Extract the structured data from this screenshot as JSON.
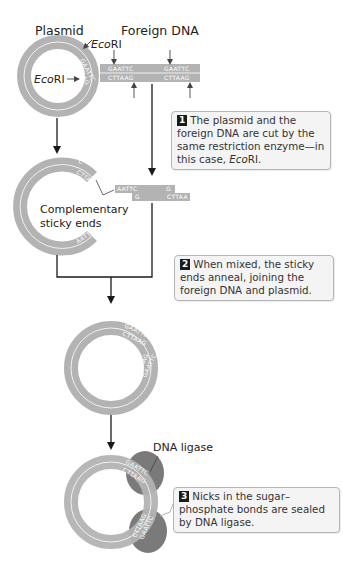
{
  "headers": {
    "plasmid": "Plasmid",
    "foreign_dna": "Foreign DNA"
  },
  "enzyme": {
    "name_italic": "Eco",
    "name_roman": "RI"
  },
  "sequences": {
    "top_strand": "GAATTC",
    "bottom_strand": "CTTAAG",
    "sticky_top_left": "AATTC",
    "sticky_top_right": "G",
    "sticky_bottom_left": "G",
    "sticky_bottom_right": "CTTAA",
    "ring_top": "C",
    "ring_bottom": "CTTA",
    "ring_lower": "AATTC"
  },
  "labels": {
    "complementary_line1": "Complementary",
    "complementary_line2": "sticky ends",
    "dna_ligase": "DNA ligase"
  },
  "steps": [
    {
      "number": "1",
      "text_before": "The plasmid and the foreign DNA are cut by the same restriction enzyme—in this case, ",
      "italic": "Eco",
      "text_after": "RI."
    },
    {
      "number": "2",
      "text": "When mixed, the sticky ends anneal, joining the foreign DNA and plasmid."
    },
    {
      "number": "3",
      "text": "Nicks in the sugar–phosphate bonds are sealed by DNA ligase."
    }
  ],
  "colors": {
    "dna_gray": "#b3b3b3",
    "ligase_gray": "#7a7a7a",
    "line": "#1a1a1a",
    "callout_bg": "#f4f4f4"
  }
}
